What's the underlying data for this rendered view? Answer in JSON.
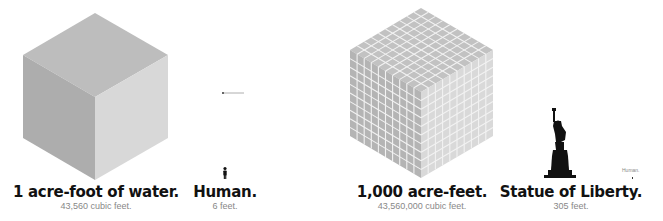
{
  "items": [
    {
      "title": "1 acre-foot of water.",
      "subtitle": "43,560 cubic feet."
    },
    {
      "title": "Human.",
      "subtitle": "6 feet."
    },
    {
      "title": "1,000 acre-feet.",
      "subtitle": "43,560,000 cubic feet."
    },
    {
      "title": "Statue of Liberty.",
      "subtitle": "305 feet."
    }
  ],
  "human_scale_label": "Human.",
  "colors": {
    "cube_top": "#bdbdbd",
    "cube_left": "#b0b0b0",
    "cube_right": "#d6d6d6",
    "grid_line": "#f2f2f2",
    "silhouette": "#111111"
  },
  "grid_cube_divisions": 10
}
